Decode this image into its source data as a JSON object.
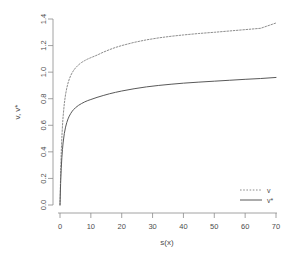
{
  "chart_data": {
    "type": "line",
    "title": "",
    "xlabel": "s(x)",
    "ylabel": "v, v*",
    "xlim": [
      -1.5,
      71
    ],
    "ylim": [
      -0.03,
      1.43
    ],
    "xticks": [
      0,
      10,
      20,
      30,
      40,
      50,
      60,
      70
    ],
    "xtick_labels": [
      "0",
      "10",
      "20",
      "30",
      "40",
      "50",
      "60",
      "70"
    ],
    "yticks": [
      0.0,
      0.2,
      0.4,
      0.6,
      0.8,
      1.0,
      1.2,
      1.4
    ],
    "ytick_labels": [
      "0.0",
      "0.2",
      "0.4",
      "0.6",
      "0.8",
      "1.0",
      "1.2",
      "1.4"
    ],
    "grid": false,
    "legend_position": "bottom-right",
    "series": [
      {
        "name": "v",
        "style": "dashed",
        "color": "#808080",
        "asymptote": 1.37,
        "x": [
          0,
          0.2,
          0.4,
          0.6,
          0.8,
          1.0,
          1.4,
          1.8,
          2.2,
          2.6,
          3.0,
          3.5,
          4.0,
          4.5,
          5.0,
          6.0,
          7.0,
          8.0,
          9.0,
          10.0,
          12.0,
          14.0,
          16.0,
          18.0,
          20.0,
          24.0,
          28.0,
          32.0,
          36.0,
          40.0,
          45.0,
          50.0,
          55.0,
          60.0,
          65.0,
          70.0
        ],
        "y": [
          0.0,
          0.233,
          0.392,
          0.508,
          0.596,
          0.665,
          0.764,
          0.832,
          0.881,
          0.918,
          0.947,
          0.976,
          0.998,
          1.016,
          1.031,
          1.055,
          1.073,
          1.087,
          1.099,
          1.109,
          1.128,
          1.15,
          1.169,
          1.186,
          1.2,
          1.224,
          1.243,
          1.258,
          1.27,
          1.28,
          1.291,
          1.3,
          1.31,
          1.32,
          1.33,
          1.37
        ]
      },
      {
        "name": "v*",
        "style": "solid",
        "color": "#595959",
        "asymptote": 0.96,
        "x": [
          0,
          0.2,
          0.4,
          0.6,
          0.8,
          1.0,
          1.4,
          1.8,
          2.2,
          2.6,
          3.0,
          3.5,
          4.0,
          4.5,
          5.0,
          6.0,
          7.0,
          8.0,
          9.0,
          10.0,
          12.0,
          14.0,
          16.0,
          18.0,
          20.0,
          24.0,
          28.0,
          32.0,
          36.0,
          40.0,
          45.0,
          50.0,
          55.0,
          60.0,
          65.0,
          70.0
        ],
        "y": [
          0.0,
          0.162,
          0.274,
          0.356,
          0.418,
          0.467,
          0.538,
          0.586,
          0.621,
          0.648,
          0.669,
          0.69,
          0.707,
          0.72,
          0.732,
          0.75,
          0.764,
          0.776,
          0.786,
          0.794,
          0.81,
          0.824,
          0.837,
          0.848,
          0.858,
          0.875,
          0.889,
          0.9,
          0.909,
          0.917,
          0.925,
          0.932,
          0.939,
          0.946,
          0.952,
          0.96
        ]
      }
    ],
    "legend": [
      {
        "label": "v",
        "style": "dashed"
      },
      {
        "label": "v*",
        "style": "solid"
      }
    ]
  }
}
